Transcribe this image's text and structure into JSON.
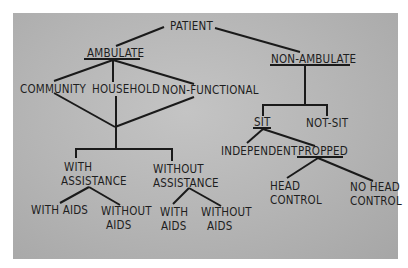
{
  "diagram": {
    "type": "tree",
    "title": "PATIENT",
    "nodes": {
      "patient": "PATIENT",
      "ambulate": "AMBULATE",
      "non_ambulate": "NON-AMBULATE",
      "community": "COMMUNITY",
      "household": "HOUSEHOLD",
      "non_functional": "NON-FUNCTIONAL",
      "with_assistance_1": "WITH",
      "with_assistance_2": "ASSISTANCE",
      "without_assistance_1": "WITHOUT",
      "without_assistance_2": "ASSISTANCE",
      "wa_with_aids": "WITH AIDS",
      "wa_without_aids_1": "WITHOUT",
      "wa_without_aids_2": "AIDS",
      "woa_with_aids_1": "WITH",
      "woa_with_aids_2": "AIDS",
      "woa_without_aids_1": "WITHOUT",
      "woa_without_aids_2": "AIDS",
      "sit": "SIT",
      "not_sit": "NOT-SIT",
      "independent": "INDEPENDENT",
      "propped": "PROPPED",
      "head_control_1": "HEAD",
      "head_control_2": "CONTROL",
      "no_head_control_1": "NO HEAD",
      "no_head_control_2": "CONTROL"
    },
    "edges": [
      [
        "PATIENT",
        "AMBULATE"
      ],
      [
        "PATIENT",
        "NON-AMBULATE"
      ],
      [
        "AMBULATE",
        "COMMUNITY"
      ],
      [
        "AMBULATE",
        "HOUSEHOLD"
      ],
      [
        "AMBULATE",
        "NON-FUNCTIONAL"
      ],
      [
        "COMMUNITY",
        "WITH/WITHOUT ASSISTANCE junction"
      ],
      [
        "HOUSEHOLD",
        "WITH/WITHOUT ASSISTANCE junction"
      ],
      [
        "NON-FUNCTIONAL",
        "WITH/WITHOUT ASSISTANCE junction"
      ],
      [
        "junction",
        "WITH ASSISTANCE"
      ],
      [
        "junction",
        "WITHOUT ASSISTANCE"
      ],
      [
        "WITH ASSISTANCE",
        "WITH AIDS"
      ],
      [
        "WITH ASSISTANCE",
        "WITHOUT AIDS"
      ],
      [
        "WITHOUT ASSISTANCE",
        "WITH AIDS"
      ],
      [
        "WITHOUT ASSISTANCE",
        "WITHOUT AIDS"
      ],
      [
        "NON-AMBULATE",
        "SIT"
      ],
      [
        "NON-AMBULATE",
        "NOT-SIT"
      ],
      [
        "SIT",
        "INDEPENDENT"
      ],
      [
        "SIT",
        "PROPPED"
      ],
      [
        "PROPPED",
        "HEAD CONTROL"
      ],
      [
        "PROPPED",
        "NO HEAD CONTROL"
      ]
    ],
    "underlined": [
      "AMBULATE",
      "NON-AMBULATE",
      "SIT",
      "PROPPED"
    ]
  }
}
